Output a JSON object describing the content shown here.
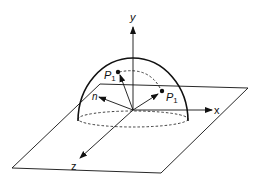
{
  "diagram": {
    "axes": {
      "x_label": "x",
      "y_label": "y",
      "z_label": "z"
    },
    "vectors": {
      "normal_label": "n",
      "point_upper_label": "P",
      "point_upper_sub": "1",
      "point_right_label": "P",
      "point_right_sub": "1"
    },
    "colors": {
      "stroke": "#111111",
      "background": "#ffffff"
    }
  }
}
